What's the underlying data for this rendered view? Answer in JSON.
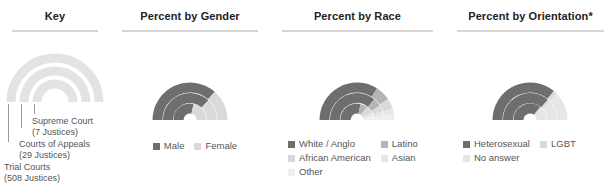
{
  "panels": {
    "key": {
      "title": "Key",
      "rings": [
        {
          "name": "Supreme Court",
          "count_label": "(7 Justices)"
        },
        {
          "name": "Courts of Appeals",
          "count_label": "(29 Justices)"
        },
        {
          "name": "Trial Courts",
          "count_label": "(508 Justices)"
        }
      ]
    },
    "gender": {
      "title": "Percent by Gender"
    },
    "race": {
      "title": "Percent by Race"
    },
    "orientation": {
      "title": "Percent by Orientation*"
    }
  },
  "colors": {
    "dark": "#6e6e6e",
    "mid": "#b4b4b4",
    "light": "#d9d9d9",
    "lighter": "#e6e6e6",
    "lightest": "#efefef",
    "key_ring": "#e3e3e3",
    "rule": "#d6d6d6"
  },
  "chart_data": [
    {
      "type": "pie",
      "title": "Percent by Gender",
      "subtype": "nested-semicircle-donut",
      "legend_position": "bottom",
      "axis_note": "180 degree sweep, left to right",
      "categories": [
        "Male",
        "Female"
      ],
      "category_colors": [
        "#6e6e6e",
        "#d9d9d9"
      ],
      "rings": [
        {
          "name": "Trial Courts",
          "justices": 508,
          "values": [
            73,
            27
          ]
        },
        {
          "name": "Courts of Appeals",
          "justices": 29,
          "values": [
            74,
            26
          ]
        },
        {
          "name": "Supreme Court",
          "justices": 7,
          "values": [
            57,
            43
          ]
        }
      ]
    },
    {
      "type": "pie",
      "title": "Percent by Race",
      "subtype": "nested-semicircle-donut",
      "legend_position": "bottom",
      "axis_note": "180 degree sweep, left to right",
      "categories": [
        "White / Anglo",
        "Latino",
        "African American",
        "Asian",
        "Other"
      ],
      "category_colors": [
        "#6e6e6e",
        "#b4b4b4",
        "#d9d9d9",
        "#e6e6e6",
        "#efefef"
      ],
      "rings": [
        {
          "name": "Trial Courts",
          "justices": 508,
          "values": [
            68,
            13,
            9,
            5,
            5
          ]
        },
        {
          "name": "Courts of Appeals",
          "justices": 29,
          "values": [
            72,
            10,
            8,
            5,
            5
          ]
        },
        {
          "name": "Supreme Court",
          "justices": 7,
          "values": [
            57,
            14,
            15,
            7,
            7
          ]
        }
      ]
    },
    {
      "type": "pie",
      "title": "Percent by Orientation*",
      "subtype": "nested-semicircle-donut",
      "legend_position": "bottom",
      "axis_note": "180 degree sweep, left to right",
      "categories": [
        "Heterosexual",
        "LGBT",
        "No answer"
      ],
      "category_colors": [
        "#6e6e6e",
        "#d9d9d9",
        "#e6e6e6"
      ],
      "rings": [
        {
          "name": "Trial Courts",
          "justices": 508,
          "values": [
            72,
            3,
            25
          ]
        },
        {
          "name": "Courts of Appeals",
          "justices": 29,
          "values": [
            73,
            3,
            24
          ]
        },
        {
          "name": "Supreme Court",
          "justices": 7,
          "values": [
            71,
            4,
            25
          ]
        }
      ]
    }
  ]
}
